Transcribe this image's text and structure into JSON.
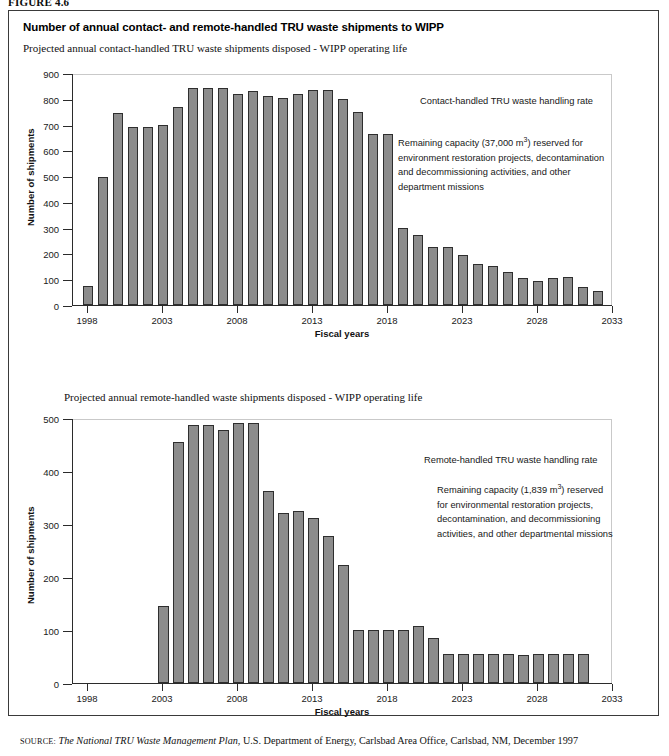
{
  "figure": {
    "label_prefix": "FIGURE",
    "label_number": "4.6",
    "label_full": "FIGURE 4.6"
  },
  "panel": {
    "title": "Number of annual contact- and remote-handled TRU waste shipments to WIPP"
  },
  "source": {
    "prefix": "SOURCE:",
    "title": "The National TRU Waste Management Plan",
    "rest": ", U.S. Department of Energy, Carlsbad Area Office, Carlsbad, NM, December 1997"
  },
  "chart_data": [
    {
      "id": "contact-handled",
      "type": "bar",
      "title": "Projected annual contact-handled TRU waste shipments disposed - WIPP operating life",
      "xlabel": "Fiscal years",
      "ylabel": "Number of shipments",
      "ylim": [
        0,
        900
      ],
      "yticks": [
        0,
        100,
        200,
        300,
        400,
        500,
        600,
        700,
        800,
        900
      ],
      "xlim": [
        1997,
        2033
      ],
      "xticks": [
        1998,
        2003,
        2008,
        2013,
        2018,
        2023,
        2028,
        2033
      ],
      "grid": false,
      "legend_position": "none",
      "bar_color": "#8c8c8c",
      "bar_edge_color": "#2e2e2e",
      "annotations": {
        "heading": "Contact-handled TRU waste handling rate",
        "body": [
          "Remaining capacity (37,000 m³) reserved for",
          "environment restoration projects, decontamination",
          "and decommissioning activities, and other",
          "department missions"
        ],
        "body_lines": [
          {
            "pre": "Remaining capacity (37,000 m",
            "sup": "3",
            "post": ") reserved for"
          },
          {
            "pre": "environment restoration projects, decontamination",
            "sup": "",
            "post": ""
          },
          {
            "pre": "and decommissioning activities, and other",
            "sup": "",
            "post": ""
          },
          {
            "pre": "department missions",
            "sup": "",
            "post": ""
          }
        ]
      },
      "x": [
        1998,
        1999,
        2000,
        2001,
        2002,
        2003,
        2004,
        2005,
        2006,
        2007,
        2008,
        2009,
        2010,
        2011,
        2012,
        2013,
        2014,
        2015,
        2016,
        2017,
        2018,
        2019,
        2020,
        2021,
        2022,
        2023,
        2024,
        2025,
        2026,
        2027,
        2028,
        2029,
        2030,
        2031,
        2032
      ],
      "categories": [
        "1998",
        "1999",
        "2000",
        "2001",
        "2002",
        "2003",
        "2004",
        "2005",
        "2006",
        "2007",
        "2008",
        "2009",
        "2010",
        "2011",
        "2012",
        "2013",
        "2014",
        "2015",
        "2016",
        "2017",
        "2018",
        "2019",
        "2020",
        "2021",
        "2022",
        "2023",
        "2024",
        "2025",
        "2026",
        "2027",
        "2028",
        "2029",
        "2030",
        "2031",
        "2032"
      ],
      "values": [
        75,
        495,
        745,
        690,
        690,
        700,
        770,
        840,
        840,
        840,
        820,
        830,
        810,
        805,
        820,
        835,
        835,
        800,
        750,
        665,
        665,
        300,
        270,
        225,
        225,
        195,
        160,
        150,
        130,
        105,
        95,
        105,
        110,
        70,
        55
      ]
    },
    {
      "id": "remote-handled",
      "type": "bar",
      "title": "Projected annual remote-handled  waste shipments disposed - WIPP operating life",
      "xlabel": "Fiscal years",
      "ylabel": "Number of shipments",
      "ylim": [
        0,
        500
      ],
      "yticks": [
        0,
        100,
        200,
        300,
        400,
        500
      ],
      "xlim": [
        1997,
        2033
      ],
      "xticks": [
        1998,
        2003,
        2008,
        2013,
        2018,
        2023,
        2028,
        2033
      ],
      "grid": false,
      "legend_position": "none",
      "bar_color": "#8c8c8c",
      "bar_edge_color": "#2e2e2e",
      "annotations": {
        "heading": "Remote-handled TRU waste handling rate",
        "body": [
          "Remaining capacity (1,839 m³) reserved",
          "for environmental restoration projects,",
          "decontamination, and decommissioning",
          "activities, and other departmental missions"
        ],
        "body_lines": [
          {
            "pre": "Remaining capacity (1,839 m",
            "sup": "3",
            "post": ") reserved"
          },
          {
            "pre": "for environmental restoration projects,",
            "sup": "",
            "post": ""
          },
          {
            "pre": "decontamination, and decommissioning",
            "sup": "",
            "post": ""
          },
          {
            "pre": "activities, and other departmental missions",
            "sup": "",
            "post": ""
          }
        ]
      },
      "x": [
        2003,
        2004,
        2005,
        2006,
        2007,
        2008,
        2009,
        2010,
        2011,
        2012,
        2013,
        2014,
        2015,
        2016,
        2017,
        2018,
        2019,
        2020,
        2021,
        2022,
        2023,
        2024,
        2025,
        2026,
        2027,
        2028,
        2029,
        2030,
        2031
      ],
      "categories": [
        "2003",
        "2004",
        "2005",
        "2006",
        "2007",
        "2008",
        "2009",
        "2010",
        "2011",
        "2012",
        "2013",
        "2014",
        "2015",
        "2016",
        "2017",
        "2018",
        "2019",
        "2020",
        "2021",
        "2022",
        "2023",
        "2024",
        "2025",
        "2026",
        "2027",
        "2028",
        "2029",
        "2030",
        "2031"
      ],
      "values": [
        145,
        455,
        487,
        487,
        478,
        490,
        490,
        362,
        320,
        325,
        312,
        278,
        222,
        100,
        100,
        100,
        100,
        108,
        85,
        55,
        55,
        55,
        55,
        55,
        52,
        55,
        55,
        55,
        55
      ]
    }
  ]
}
